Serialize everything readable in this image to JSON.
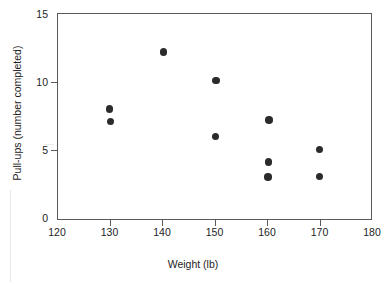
{
  "chart_data": {
    "type": "scatter",
    "title": "",
    "xlabel": "Weight (lb)",
    "ylabel": "Pull-ups (number completed)",
    "xlim": [
      120,
      180
    ],
    "ylim": [
      0,
      15
    ],
    "xticks": [
      120,
      130,
      140,
      150,
      160,
      170,
      180
    ],
    "yticks": [
      0,
      5,
      10,
      15
    ],
    "xtick_labels": [
      "120",
      "130",
      "140",
      "150",
      "160",
      "170",
      "180"
    ],
    "ytick_labels": [
      "0",
      "5",
      "10",
      "15"
    ],
    "grid": false,
    "legend": null,
    "marker": {
      "shape": "circle",
      "color": "#2b2b2b",
      "size_px": 7.5
    },
    "frame_color": "#5a5a5a",
    "background": "#ffffff",
    "points": [
      {
        "x": 130.0,
        "y": 8.0
      },
      {
        "x": 130.2,
        "y": 7.1
      },
      {
        "x": 140.3,
        "y": 12.2
      },
      {
        "x": 150.3,
        "y": 10.1
      },
      {
        "x": 150.2,
        "y": 6.0
      },
      {
        "x": 160.4,
        "y": 7.2
      },
      {
        "x": 160.3,
        "y": 4.1
      },
      {
        "x": 160.2,
        "y": 3.0
      },
      {
        "x": 170.0,
        "y": 5.05
      },
      {
        "x": 170.0,
        "y": 3.05
      }
    ]
  }
}
